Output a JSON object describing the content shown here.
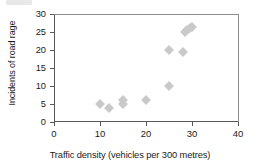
{
  "chart_data": {
    "type": "scatter",
    "title": "",
    "xlabel": "Traffic density (vehicles per 300 metres)",
    "ylabel": "Incidents of road rage",
    "xlim": [
      0,
      40
    ],
    "ylim": [
      0,
      30
    ],
    "xticks": [
      "0",
      "10",
      "20",
      "30",
      "40"
    ],
    "yticks": [
      "0",
      "5",
      "10",
      "15",
      "20",
      "25",
      "30"
    ],
    "xtick_values": [
      0,
      10,
      20,
      30,
      40
    ],
    "ytick_values": [
      0,
      5,
      10,
      15,
      20,
      25,
      30
    ],
    "grid": false,
    "legend": false,
    "marker_shape": "diamond",
    "marker_color": "#c9c9c9",
    "points": [
      {
        "x": 10,
        "y": 5
      },
      {
        "x": 12,
        "y": 4
      },
      {
        "x": 15,
        "y": 5
      },
      {
        "x": 15,
        "y": 6
      },
      {
        "x": 20,
        "y": 6
      },
      {
        "x": 25,
        "y": 10
      },
      {
        "x": 25,
        "y": 20
      },
      {
        "x": 28,
        "y": 19.5
      },
      {
        "x": 28.5,
        "y": 25
      },
      {
        "x": 29,
        "y": 25.5
      },
      {
        "x": 29.5,
        "y": 26
      },
      {
        "x": 30,
        "y": 26.5
      }
    ]
  }
}
